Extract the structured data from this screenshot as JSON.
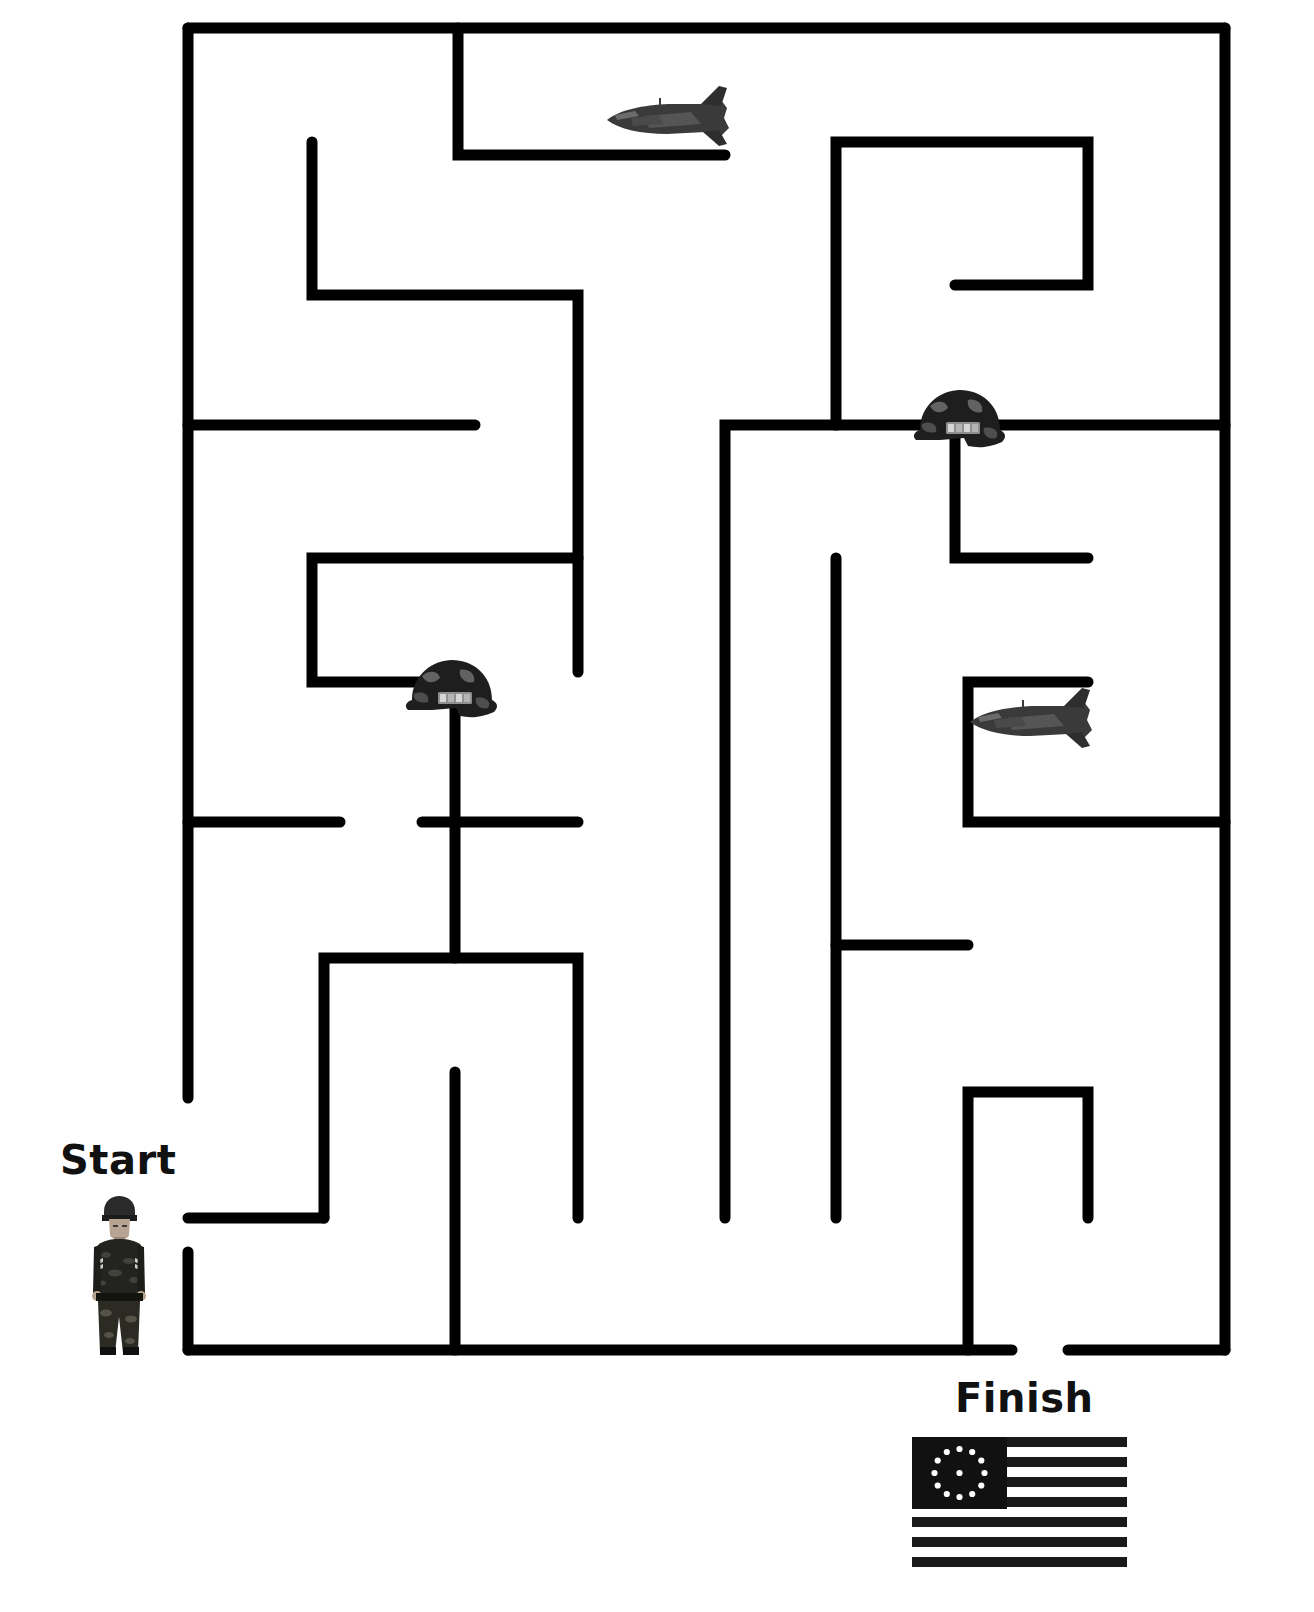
{
  "page": {
    "width": 1314,
    "height": 1612,
    "background_color": "#ffffff",
    "wall_color": "#000000",
    "wall_thickness": 11
  },
  "labels": {
    "start": "Start",
    "finish": "Finish"
  },
  "markers": {
    "start_icon": "soldier-figure",
    "finish_icon": "betsy-ross-flag"
  },
  "decorations": [
    {
      "icon": "fighter-jet-icon",
      "x": 605,
      "y": 98,
      "width": 125,
      "height": 42,
      "facing": "left"
    },
    {
      "icon": "army-helmet-icon",
      "x": 912,
      "y": 388,
      "width": 96,
      "height": 56
    },
    {
      "icon": "army-helmet-icon",
      "x": 404,
      "y": 658,
      "width": 96,
      "height": 56
    },
    {
      "icon": "fighter-jet-icon",
      "x": 968,
      "y": 700,
      "width": 125,
      "height": 42,
      "facing": "left"
    }
  ],
  "maze": {
    "border": {
      "left": 188,
      "top": 28,
      "right": 1225,
      "bottom": 1350,
      "entrance": {
        "side": "left",
        "from_y": 1098,
        "to_y": 1252
      },
      "exit": {
        "side": "bottom",
        "from_x": 1012,
        "to_x": 1068
      }
    },
    "walls": [
      "M188,28 L1225,28",
      "M1225,28 L1225,1350",
      "M188,28 L188,1098",
      "M188,1252 L188,1350",
      "M188,1350 L1012,1350",
      "M1068,1350 L1225,1350",
      "M458,28 L458,155",
      "M458,155 L725,155",
      "M312,142 L312,295",
      "M312,295 L578,295",
      "M578,295 L578,672",
      "M188,425 L475,425",
      "M1088,142 L1088,285",
      "M836,142 L1088,142",
      "M836,142 L836,425",
      "M955,285 L1088,285",
      "M725,425 L1225,425",
      "M725,425 L725,1218",
      "M955,405 L955,558",
      "M955,558 L1088,558",
      "M312,558 L578,558",
      "M312,558 L312,682",
      "M312,682 L455,682",
      "M455,682 L455,958",
      "M188,822 L340,822",
      "M422,822 L578,822",
      "M836,558 L836,1218",
      "M968,682 L1088,682",
      "M968,682 L968,822",
      "M968,822 L1225,822",
      "M324,958 L578,958",
      "M324,958 L324,1218",
      "M578,958 L578,1218",
      "M836,945 L968,945",
      "M455,1072 L455,1350",
      "M968,1092 L1088,1092",
      "M1088,1092 L1088,1218",
      "M188,1218 L324,1218",
      "M188,1218 L188,1350",
      "M968,1092 L968,1350"
    ]
  }
}
